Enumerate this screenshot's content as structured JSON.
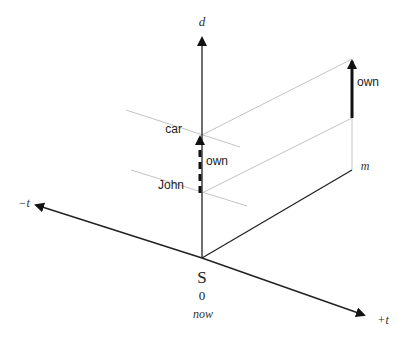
{
  "diagram": {
    "type": "3D time-relation axes diagram",
    "axes": {
      "vertical": {
        "label": "d"
      },
      "negative_time": {
        "label": "−t"
      },
      "positive_time": {
        "label": "+t"
      },
      "depth": {
        "label": "m"
      }
    },
    "origin": {
      "symbol": "S",
      "value": "0",
      "caption": "now"
    },
    "entities": [
      {
        "label": "car"
      },
      {
        "label": "John"
      }
    ],
    "relations": [
      {
        "label": "own",
        "style": "dashed",
        "location": "at origin (now)"
      },
      {
        "label": "own",
        "style": "solid",
        "location": "at m"
      }
    ],
    "colors": {
      "axis": "#222222",
      "guide_line": "#bbbbbb",
      "text": "#222222"
    }
  }
}
